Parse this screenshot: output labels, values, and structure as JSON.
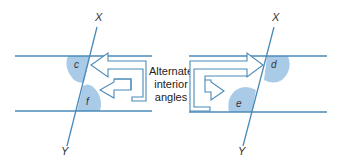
{
  "diagram": {
    "title": "Alternate interior angles",
    "caption_lines": [
      "Alternate",
      "interior",
      "angles"
    ],
    "colors": {
      "line": "#4a8ab8",
      "shade": "#a9cbe8",
      "arrow_stroke": "#4a8ab8",
      "text": "#222222"
    },
    "left": {
      "transversal_top_label": "X",
      "transversal_bottom_label": "Y",
      "angle_upper_label": "c",
      "angle_lower_label": "f"
    },
    "right": {
      "transversal_top_label": "X",
      "transversal_bottom_label": "Y",
      "angle_upper_label": "d",
      "angle_lower_label": "e"
    }
  }
}
